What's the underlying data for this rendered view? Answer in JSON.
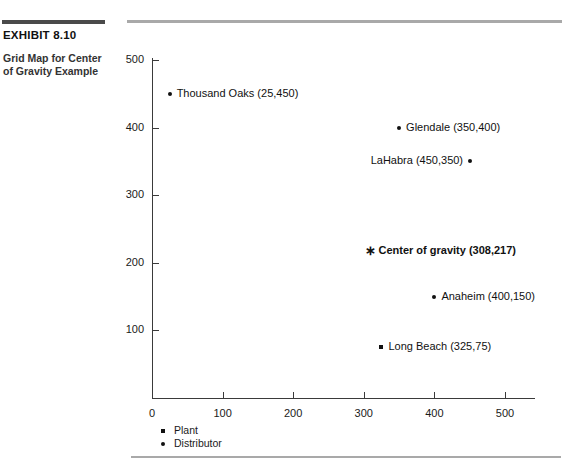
{
  "exhibit": {
    "label": "EXHIBIT 8.10",
    "caption": "Grid Map for Center of Gravity Example"
  },
  "chart_data": {
    "type": "scatter",
    "title": "Grid Map for Center of Gravity Example",
    "xlabel": "",
    "ylabel": "",
    "xlim": [
      0,
      540
    ],
    "ylim": [
      0,
      520
    ],
    "xticks": [
      "0",
      "100",
      "200",
      "300",
      "400",
      "500"
    ],
    "yticks": [
      "100",
      "200",
      "300",
      "400",
      "500"
    ],
    "grid": false,
    "legend_position": "bottom-left",
    "legend": [
      {
        "marker": "square",
        "label": "Plant"
      },
      {
        "marker": "dot",
        "label": "Distributor"
      }
    ],
    "points": [
      {
        "name": "Thousand Oaks",
        "label": "Thousand Oaks (25,450)",
        "x": 25,
        "y": 450,
        "marker": "dot",
        "type": "distributor",
        "label_side": "right",
        "bold": false
      },
      {
        "name": "Glendale",
        "label": "Glendale (350,400)",
        "x": 350,
        "y": 400,
        "marker": "dot",
        "type": "distributor",
        "label_side": "right",
        "bold": false
      },
      {
        "name": "LaHabra",
        "label": "LaHabra (450,350)",
        "x": 450,
        "y": 350,
        "marker": "dot",
        "type": "distributor",
        "label_side": "left",
        "bold": false
      },
      {
        "name": "Center of gravity",
        "label": "Center of gravity (308,217)",
        "x": 308,
        "y": 217,
        "marker": "star",
        "type": "center-of-gravity",
        "label_side": "right",
        "bold": true
      },
      {
        "name": "Anaheim",
        "label": "Anaheim (400,150)",
        "x": 400,
        "y": 150,
        "marker": "dot",
        "type": "distributor",
        "label_side": "right",
        "bold": false
      },
      {
        "name": "Long Beach",
        "label": "Long Beach (325,75)",
        "x": 325,
        "y": 75,
        "marker": "square",
        "type": "plant",
        "label_side": "right",
        "bold": false
      }
    ]
  },
  "colors": {
    "rule_dark": "#4a4a4a",
    "rule_light": "#a9a9a9",
    "axis": "#3a3a3a",
    "marker": "#111111",
    "text": "#1a1a1a"
  }
}
